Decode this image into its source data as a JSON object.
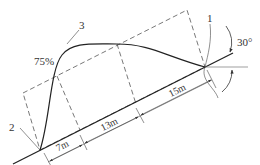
{
  "diagram": {
    "type": "engineering-schematic",
    "colors": {
      "line": "#333333",
      "dashed": "#555555",
      "thin": "#666666",
      "background": "#ffffff"
    },
    "labels": {
      "point1": "1",
      "point2": "2",
      "point3": "3",
      "percent": "75%",
      "angle": "30°"
    },
    "dimensions": [
      {
        "label": "7m"
      },
      {
        "label": "13m"
      },
      {
        "label": "15m"
      }
    ]
  }
}
